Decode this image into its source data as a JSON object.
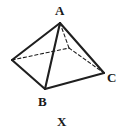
{
  "figure": {
    "caption": "X",
    "kind": "square-based-pyramid",
    "background_color": "#ffffff",
    "stroke_color": "#1f1f1f",
    "solid_stroke_width": 2.1,
    "hidden_stroke_width": 1.1,
    "hidden_dash_pattern": "3.2 2.6",
    "viewbox": "0 0 121 134",
    "vertices": [
      {
        "id": "A",
        "label": "A",
        "role": "apex",
        "x": 60,
        "y": 23,
        "visible_label": true
      },
      {
        "id": "B",
        "label": "B",
        "role": "base-front",
        "x": 45,
        "y": 89,
        "visible_label": true
      },
      {
        "id": "C",
        "label": "C",
        "role": "base-right",
        "x": 104,
        "y": 73,
        "visible_label": true
      },
      {
        "id": "L",
        "label": "",
        "role": "base-left",
        "x": 12,
        "y": 60,
        "visible_label": false
      },
      {
        "id": "D",
        "label": "",
        "role": "base-back-hidden",
        "x": 69,
        "y": 48,
        "visible_label": false
      }
    ],
    "edges_solid": [
      {
        "id": "edge-A-L",
        "from": "A",
        "to": "L"
      },
      {
        "id": "edge-A-B",
        "from": "A",
        "to": "B"
      },
      {
        "id": "edge-A-C",
        "from": "A",
        "to": "C"
      },
      {
        "id": "edge-L-B",
        "from": "L",
        "to": "B"
      },
      {
        "id": "edge-B-C",
        "from": "B",
        "to": "C"
      }
    ],
    "edges_hidden": [
      {
        "id": "edge-L-D",
        "from": "L",
        "to": "D"
      },
      {
        "id": "edge-A-D",
        "from": "A",
        "to": "D"
      },
      {
        "id": "edge-D-C",
        "from": "D",
        "to": "C"
      }
    ],
    "labels": {
      "A": "A",
      "B": "B",
      "C": "C"
    }
  }
}
